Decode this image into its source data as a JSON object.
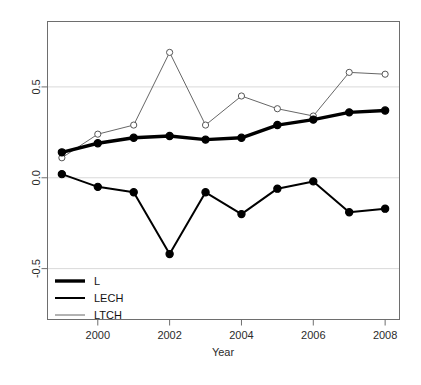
{
  "chart_data": {
    "type": "line",
    "title": "",
    "subtitle": "",
    "xlabel": "Year",
    "ylabel": "",
    "x": [
      1999,
      2000,
      2001,
      2002,
      2003,
      2004,
      2005,
      2006,
      2007,
      2008
    ],
    "xtick_labels": [
      "2000",
      "2002",
      "2004",
      "2006",
      "2008"
    ],
    "xtick_values": [
      2000,
      2002,
      2004,
      2006,
      2008
    ],
    "ytick_labels": [
      "-0.5",
      "0.0",
      "0.5"
    ],
    "ytick_values": [
      -0.5,
      0.0,
      0.5
    ],
    "xlim": [
      1998.6,
      2008.4
    ],
    "ylim": [
      -0.78,
      0.86
    ],
    "grid": "horizontal-at-yticks",
    "legend_position": "bottom-left",
    "series": [
      {
        "name": "L",
        "style": "thick-solid-filled-circles",
        "color": "#000000",
        "line_width": 3.4,
        "marker": "filled-circle",
        "values": [
          0.14,
          0.19,
          0.22,
          0.23,
          0.21,
          0.22,
          0.29,
          0.32,
          0.36,
          0.37
        ]
      },
      {
        "name": "LECH",
        "style": "medium-solid-filled-circles",
        "color": "#000000",
        "line_width": 2.0,
        "marker": "filled-circle",
        "values": [
          0.02,
          -0.05,
          -0.08,
          -0.42,
          -0.08,
          -0.2,
          -0.06,
          -0.02,
          -0.19,
          -0.17
        ]
      },
      {
        "name": "LTCH",
        "style": "thin-solid-open-circles",
        "color": "#555555",
        "line_width": 0.9,
        "marker": "open-circle",
        "values": [
          0.11,
          0.24,
          0.29,
          0.69,
          0.29,
          0.45,
          0.38,
          0.34,
          0.58,
          0.57
        ]
      }
    ],
    "legend_entries": [
      {
        "label": "L"
      },
      {
        "label": "LECH"
      },
      {
        "label": "LTCH"
      }
    ],
    "colors": {
      "background": "#ffffff",
      "axis": "#6e6e6e",
      "grid": "#d9d9d9",
      "series_primary": "#000000",
      "series_thin": "#555555"
    }
  }
}
